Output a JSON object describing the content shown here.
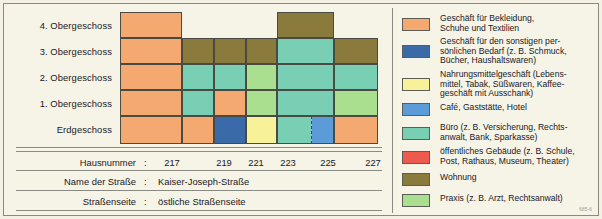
{
  "diagram": {
    "floor_labels": [
      "4. Obergeschoss",
      "3. Obergeschoss",
      "2. Obergeschoss",
      "1. Obergeschoss",
      "Erdgeschoss"
    ],
    "house_numbers": [
      "217",
      "219",
      "221",
      "223",
      "225",
      "227"
    ],
    "colors": {
      "clothing": "#f4a971",
      "personal_goods": "#3a6ba8",
      "food": "#f7f19a",
      "cafe": "#5b9bd8",
      "office": "#79cfb4",
      "public_building": "#ef5a4f",
      "dwelling": "#8a7a3c",
      "practice": "#a9df8e",
      "empty": "#00000000"
    },
    "cells": [
      {
        "floor": "4. Obergeschoss",
        "house": "217",
        "use": "clothing"
      },
      {
        "floor": "4. Obergeschoss",
        "house": "219",
        "use": "empty"
      },
      {
        "floor": "4. Obergeschoss",
        "house": "221",
        "use": "empty"
      },
      {
        "floor": "4. Obergeschoss",
        "house": "223",
        "use": "empty"
      },
      {
        "floor": "4. Obergeschoss",
        "house": "225",
        "use": "dwelling"
      },
      {
        "floor": "4. Obergeschoss",
        "house": "227",
        "use": "empty"
      },
      {
        "floor": "3. Obergeschoss",
        "house": "217",
        "use": "clothing"
      },
      {
        "floor": "3. Obergeschoss",
        "house": "219",
        "use": "dwelling"
      },
      {
        "floor": "3. Obergeschoss",
        "house": "221",
        "use": "dwelling"
      },
      {
        "floor": "3. Obergeschoss",
        "house": "223",
        "use": "dwelling"
      },
      {
        "floor": "3. Obergeschoss",
        "house": "225",
        "use": "office"
      },
      {
        "floor": "3. Obergeschoss",
        "house": "227",
        "use": "dwelling"
      },
      {
        "floor": "2. Obergeschoss",
        "house": "217",
        "use": "clothing"
      },
      {
        "floor": "2. Obergeschoss",
        "house": "219",
        "use": "office"
      },
      {
        "floor": "2. Obergeschoss",
        "house": "221",
        "use": "office"
      },
      {
        "floor": "2. Obergeschoss",
        "house": "223",
        "use": "practice"
      },
      {
        "floor": "2. Obergeschoss",
        "house": "225",
        "use": "office"
      },
      {
        "floor": "2. Obergeschoss",
        "house": "227",
        "use": "office"
      },
      {
        "floor": "1. Obergeschoss",
        "house": "217",
        "use": "clothing"
      },
      {
        "floor": "1. Obergeschoss",
        "house": "219",
        "use": "office"
      },
      {
        "floor": "1. Obergeschoss",
        "house": "221",
        "use": "clothing"
      },
      {
        "floor": "1. Obergeschoss",
        "house": "223",
        "use": "practice"
      },
      {
        "floor": "1. Obergeschoss",
        "house": "225",
        "use": "office"
      },
      {
        "floor": "1. Obergeschoss",
        "house": "227",
        "use": "practice"
      },
      {
        "floor": "Erdgeschoss",
        "house": "217",
        "use": "clothing"
      },
      {
        "floor": "Erdgeschoss",
        "house": "219",
        "use": "clothing"
      },
      {
        "floor": "Erdgeschoss",
        "house": "221",
        "use": "personal_goods"
      },
      {
        "floor": "Erdgeschoss",
        "house": "223",
        "use": "food"
      },
      {
        "floor": "Erdgeschoss",
        "house": "225",
        "use": "office"
      },
      {
        "floor": "Erdgeschoss",
        "house": "225b",
        "use": "cafe"
      },
      {
        "floor": "Erdgeschoss",
        "house": "227",
        "use": "clothing"
      }
    ]
  },
  "info": {
    "rows": [
      {
        "label": "Hausnummer",
        "colon": ":",
        "value": ""
      },
      {
        "label": "Name der Straße",
        "colon": ":",
        "value": "Kaiser-Joseph-Straße"
      },
      {
        "label": "Straßenseite",
        "colon": ":",
        "value": "östliche Straßenseite"
      }
    ]
  },
  "legend": {
    "items": [
      {
        "color": "#f4a971",
        "text": "Geschäft für Bekleidung,\nSchuhe und Textilien"
      },
      {
        "color": "#3a6ba8",
        "text": "Geschäft für den sonstigen per-\nsönlichen Bedarf (z. B. Schmuck,\nBücher, Haushaltswaren)"
      },
      {
        "color": "#f7f19a",
        "text": "Nahrungsmittelgeschäft (Lebens-\nmittel, Tabak, Süßwaren, Kaffee-\ngeschäft mit Ausschank)"
      },
      {
        "color": "#5b9bd8",
        "text": "Café, Gaststätte, Hotel"
      },
      {
        "color": "#79cfb4",
        "text": "Büro (z. B. Versicherung, Rechts-\nanwalt, Bank, Sparkasse)"
      },
      {
        "color": "#ef5a4f",
        "text": "öffentliches Gebäude (z. B. Schule,\nPost, Rathaus, Museum, Theater)"
      },
      {
        "color": "#8a7a3c",
        "text": "Wohnung"
      },
      {
        "color": "#a9df8e",
        "text": "Praxis (z. B. Arzt, Rechtsanwalt)"
      }
    ]
  },
  "source": "685-6"
}
